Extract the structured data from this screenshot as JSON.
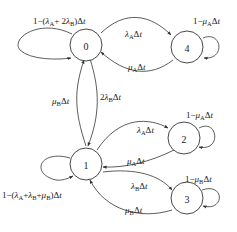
{
  "diagram": {
    "type": "state-transition (Markov chain)",
    "nodes": [
      {
        "id": "0",
        "label": "0"
      },
      {
        "id": "4",
        "label": "4"
      },
      {
        "id": "1",
        "label": "1"
      },
      {
        "id": "2",
        "label": "2"
      },
      {
        "id": "3",
        "label": "3"
      }
    ],
    "edges": [
      {
        "from": "0",
        "to": "0",
        "label": "1-(λA+2λB)Δt"
      },
      {
        "from": "0",
        "to": "4",
        "label": "λAΔt"
      },
      {
        "from": "4",
        "to": "0",
        "label": "μAΔt"
      },
      {
        "from": "4",
        "to": "4",
        "label": "1-μAΔt"
      },
      {
        "from": "0",
        "to": "1",
        "label": "2λBΔt"
      },
      {
        "from": "1",
        "to": "0",
        "label": "μBΔt"
      },
      {
        "from": "1",
        "to": "2",
        "label": "λAΔt"
      },
      {
        "from": "2",
        "to": "1",
        "label": "μAΔt"
      },
      {
        "from": "2",
        "to": "2",
        "label": "1-μAΔt"
      },
      {
        "from": "1",
        "to": "3",
        "label": "λBΔt"
      },
      {
        "from": "3",
        "to": "1",
        "label": "μBΔt"
      },
      {
        "from": "3",
        "to": "3",
        "label": "1-μB�Dt"
      },
      {
        "from": "1",
        "to": "1",
        "label": "1-(λA+λB+μB)Δt"
      }
    ]
  }
}
